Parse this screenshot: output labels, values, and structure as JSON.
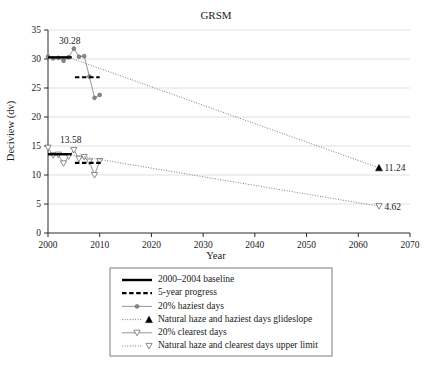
{
  "chart_data": {
    "type": "line",
    "title": "GRSM",
    "xlabel": "Year",
    "ylabel": "Deciview (dv)",
    "xlim": [
      2000,
      2070
    ],
    "ylim": [
      0,
      35
    ],
    "xticks": [
      2000,
      2010,
      2020,
      2030,
      2040,
      2050,
      2060,
      2070
    ],
    "yticks": [
      0,
      5,
      10,
      15,
      20,
      25,
      30,
      35
    ],
    "grid": "horizontal",
    "legend_position": "below-plot",
    "annotations": [
      {
        "name": "haziest-baseline-value",
        "text": "30.28",
        "x": 2004.2,
        "y": 32.6
      },
      {
        "name": "clearest-baseline-value",
        "text": "13.58",
        "x": 2004.4,
        "y": 15.6
      },
      {
        "name": "haziest-glideslope-endpoint-value",
        "text": "11.24",
        "x": 2064,
        "y": 11.24
      },
      {
        "name": "clearest-glideslope-endpoint-value",
        "text": "4.62",
        "x": 2064,
        "y": 4.62
      }
    ],
    "series": [
      {
        "name": "20% haziest days",
        "marker": "circle",
        "color": "#8a8a8a",
        "x": [
          2000,
          2001,
          2002,
          2003,
          2004,
          2005,
          2006,
          2007,
          2008,
          2009,
          2010
        ],
        "values": [
          30.4,
          30.1,
          30.2,
          29.7,
          30.3,
          31.8,
          30.4,
          30.5,
          27.0,
          23.3,
          23.8
        ]
      },
      {
        "name": "20% clearest days",
        "marker": "triangle-open",
        "color": "#8a8a8a",
        "x": [
          2000,
          2001,
          2002,
          2003,
          2004,
          2005,
          2006,
          2007,
          2008,
          2009,
          2010
        ],
        "values": [
          14.7,
          13.4,
          13.5,
          12.0,
          13.2,
          14.3,
          12.8,
          13.1,
          12.3,
          10.0,
          12.4
        ]
      },
      {
        "name": "2000-2004 baseline (haziest)",
        "style": "solid-bar",
        "color": "#000000",
        "x": [
          2000,
          2004.6
        ],
        "values": [
          30.28,
          30.28
        ]
      },
      {
        "name": "2000-2004 baseline (clearest)",
        "style": "solid-bar",
        "color": "#000000",
        "x": [
          2000,
          2004.6
        ],
        "values": [
          13.58,
          13.58
        ]
      },
      {
        "name": "5-year progress (haziest)",
        "style": "dashed-bar",
        "color": "#000000",
        "x": [
          2005.2,
          2010.0
        ],
        "values": [
          26.85,
          26.85
        ]
      },
      {
        "name": "5-year progress (clearest)",
        "style": "dashed-bar",
        "color": "#000000",
        "x": [
          2005.2,
          2010.2
        ],
        "values": [
          12.1,
          12.1
        ]
      },
      {
        "name": "Natural haze and haziest days glideslope",
        "style": "dotted-line",
        "marker": "triangle-filled",
        "color": "#6e6e6e",
        "x": [
          2004,
          2064
        ],
        "values": [
          30.28,
          11.24
        ]
      },
      {
        "name": "Natural haze and clearest days upper limit",
        "style": "dotted-line",
        "marker": "triangle-open",
        "color": "#6e6e6e",
        "x": [
          2004,
          2064
        ],
        "values": [
          13.58,
          4.62
        ]
      }
    ],
    "legend": [
      {
        "label": "2000–2004 baseline",
        "marker": "solid-black-line"
      },
      {
        "label": "5-year progress",
        "marker": "dashed-black-line"
      },
      {
        "label": "20% haziest days",
        "marker": "gray-line-circle"
      },
      {
        "label": "Natural haze and haziest days glideslope",
        "marker": "dotted-line-filled-triangle"
      },
      {
        "label": "20% clearest days",
        "marker": "gray-line-triangle"
      },
      {
        "label": "Natural haze and clearest days upper limit",
        "marker": "dotted-line-open-triangle"
      }
    ]
  }
}
